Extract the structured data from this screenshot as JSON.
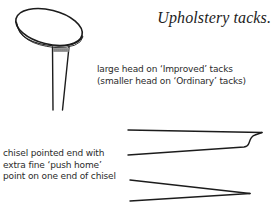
{
  "title": "Upholstery tacks.",
  "labels": {
    "head": {
      "lines": [
        "large head on ‘Improved’ tacks",
        "(smaller head on ‘Ordinary’ tacks)"
      ]
    },
    "chisel": {
      "lines": [
        "chisel pointed end with",
        "extra fine ‘push home’",
        "point on one end of chisel"
      ]
    }
  },
  "figures": {
    "tack": "upholstery-tack-side-view",
    "chisel_profile": "chisel-pointed-end-with-push-home-point",
    "chisel_point": "fine-point-end"
  },
  "colors": {
    "ink": "#1c1c1c",
    "background": "#ffffff"
  }
}
